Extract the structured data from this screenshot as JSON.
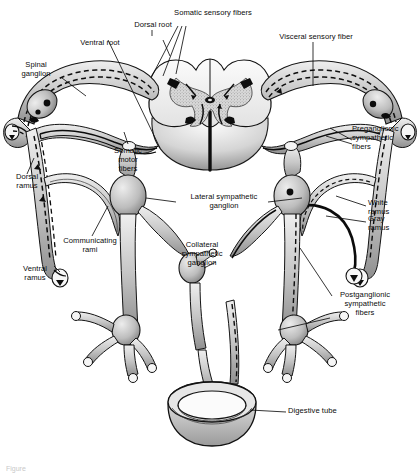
{
  "figure": {
    "background_color": "#ffffff",
    "ink_color": "#111111",
    "caption_fragment": "Figure"
  },
  "labels": [
    {
      "id": "dorsal-root",
      "text": "Dorsal root"
    },
    {
      "id": "ventral-root",
      "text": "Ventral root"
    },
    {
      "id": "somatic-sensory-fibers",
      "text": "Somatic sensory fibers"
    },
    {
      "id": "visceral-sensory-fiber",
      "text": "Visceral sensory fiber"
    },
    {
      "id": "spinal-ganglion",
      "text": "Spinal\nganglion"
    },
    {
      "id": "preganglionic-sympathetic-fibers",
      "text": "Preganglionic\nsympathetic\nfibers"
    },
    {
      "id": "dorsal-ramus",
      "text": "Dorsal\nramus"
    },
    {
      "id": "somatic-motor-fibers",
      "text": "Somatic\nmotor\nfibers"
    },
    {
      "id": "lateral-sympathetic-ganglion",
      "text": "Lateral sympathetic\nganglion"
    },
    {
      "id": "white-ramus",
      "text": "White\nramus"
    },
    {
      "id": "gray-ramus",
      "text": "Gray\nramus"
    },
    {
      "id": "communicating-rami",
      "text": "Communicating\nrami"
    },
    {
      "id": "collateral-sympathetic-ganglion",
      "text": "Collateral\nsympathetic\nganglion"
    },
    {
      "id": "ventral-ramus",
      "text": "Ventral\nramus"
    },
    {
      "id": "postganglionic-sympathetic-fibers",
      "text": "Postganglionic\nsympathetic\nfibers"
    },
    {
      "id": "digestive-tube",
      "text": "Digestive tube"
    }
  ]
}
